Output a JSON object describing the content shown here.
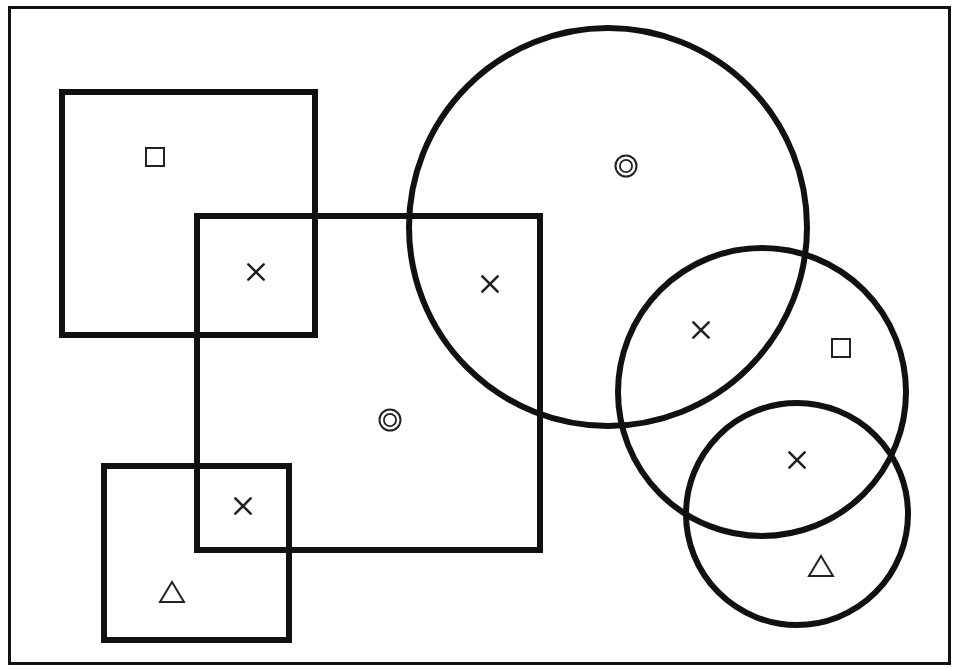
{
  "figure": {
    "canvas": {
      "width": 959,
      "height": 670
    },
    "background_color": "#ffffff",
    "stroke_color": "#111111",
    "marker_stroke_color": "#222222"
  },
  "frame": {
    "name": "outer-border",
    "x": 8,
    "y": 6,
    "width": 943,
    "height": 659,
    "stroke_width": 3
  },
  "shapes": [
    {
      "id": "square-top-left",
      "label": "Top left square",
      "type": "rect",
      "x": 59,
      "y": 89,
      "width": 259,
      "height": 249,
      "stroke_width": 6
    },
    {
      "id": "square-center",
      "label": "Center square",
      "type": "rect",
      "x": 194,
      "y": 213,
      "width": 349,
      "height": 340,
      "stroke_width": 6
    },
    {
      "id": "square-bottom-left",
      "label": "Bottom left square",
      "type": "rect",
      "x": 101,
      "y": 463,
      "width": 191,
      "height": 180,
      "stroke_width": 6
    },
    {
      "id": "circle-large",
      "label": "Large circle",
      "type": "circle",
      "cx": 608,
      "cy": 227,
      "r": 202,
      "stroke_width": 6
    },
    {
      "id": "circle-medium",
      "label": "Medium circle",
      "type": "circle",
      "cx": 762,
      "cy": 392,
      "r": 147,
      "stroke_width": 6
    },
    {
      "id": "circle-small",
      "label": "Small circle",
      "type": "circle",
      "cx": 797,
      "cy": 514,
      "r": 114,
      "stroke_width": 6
    }
  ],
  "markers": [
    {
      "id": "marker-square-1",
      "glyph": "square",
      "label": "Square marker in top left square",
      "cx": 155,
      "cy": 157,
      "size": 18
    },
    {
      "id": "marker-cross-1",
      "glyph": "cross",
      "label": "X marker in top-left / center square overlap",
      "cx": 256,
      "cy": 272,
      "size": 18
    },
    {
      "id": "marker-cross-2",
      "glyph": "cross",
      "label": "X marker in center square and large circle overlap",
      "cx": 490,
      "cy": 284,
      "size": 18
    },
    {
      "id": "marker-bullseye-1",
      "glyph": "bullseye",
      "label": "Double circle marker inside large circle",
      "cx": 626,
      "cy": 166,
      "size": 21
    },
    {
      "id": "marker-bullseye-2",
      "glyph": "bullseye",
      "label": "Double circle marker inside center square",
      "cx": 390,
      "cy": 420,
      "size": 21
    },
    {
      "id": "marker-cross-3",
      "glyph": "cross",
      "label": "X marker in large and medium circle overlap",
      "cx": 701,
      "cy": 330,
      "size": 18
    },
    {
      "id": "marker-square-2",
      "glyph": "square",
      "label": "Square marker inside medium circle",
      "cx": 841,
      "cy": 348,
      "size": 18
    },
    {
      "id": "marker-cross-4",
      "glyph": "cross",
      "label": "X marker in medium and small circle overlap",
      "cx": 797,
      "cy": 460,
      "size": 18
    },
    {
      "id": "marker-triangle-1",
      "glyph": "triangle",
      "label": "Triangle marker inside small circle",
      "cx": 821,
      "cy": 566,
      "size": 24
    },
    {
      "id": "marker-cross-5",
      "glyph": "cross",
      "label": "X marker in bottom-left / center square overlap",
      "cx": 243,
      "cy": 506,
      "size": 18
    },
    {
      "id": "marker-triangle-2",
      "glyph": "triangle",
      "label": "Triangle marker inside bottom left square",
      "cx": 172,
      "cy": 592,
      "size": 24
    }
  ]
}
